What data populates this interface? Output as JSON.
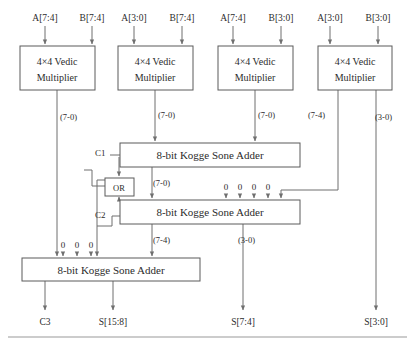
{
  "diagram": {
    "colors": {
      "wire": "#6f6f6f",
      "box_border": "#5a5a5a",
      "text": "#2b2b2b",
      "background": "#ffffff"
    },
    "inputs": [
      {
        "label": "A[7:4]",
        "x": 45,
        "y": 18
      },
      {
        "label": "B[7:4]",
        "x": 92,
        "y": 18
      },
      {
        "label": "A[3:0]",
        "x": 134,
        "y": 18
      },
      {
        "label": "B[7:4]",
        "x": 182,
        "y": 18
      },
      {
        "label": "A[7:4]",
        "x": 233,
        "y": 18
      },
      {
        "label": "B[3:0]",
        "x": 281,
        "y": 18
      },
      {
        "label": "A[3:0]",
        "x": 330,
        "y": 18
      },
      {
        "label": "B[3:0]",
        "x": 378,
        "y": 18
      }
    ],
    "multipliers": [
      {
        "line1": "4×4 Vedic",
        "line2": "Multiplier",
        "x": 20,
        "y": 46,
        "w": 75,
        "h": 44
      },
      {
        "line1": "4×4 Vedic",
        "line2": "Multiplier",
        "x": 118,
        "y": 46,
        "w": 75,
        "h": 44
      },
      {
        "line1": "4×4 Vedic",
        "line2": "Multiplier",
        "x": 218,
        "y": 46,
        "w": 75,
        "h": 44
      },
      {
        "line1": "4×4 Vedic",
        "line2": "Multiplier",
        "x": 318,
        "y": 46,
        "w": 74,
        "h": 44
      }
    ],
    "adders": [
      {
        "label": "8-bit Kogge Sone Adder",
        "x": 120,
        "y": 143,
        "w": 180,
        "h": 24
      },
      {
        "label": "8-bit Kogge Sone Adder",
        "x": 120,
        "y": 200,
        "w": 180,
        "h": 24
      },
      {
        "label": "8-bit Kogge Sone Adder",
        "x": 22,
        "y": 258,
        "w": 178,
        "h": 23
      }
    ],
    "or_gate": {
      "label": "OR",
      "x": 105,
      "y": 178,
      "w": 29,
      "h": 18
    },
    "bus_labels": [
      {
        "text": "(7-0)",
        "x": 60,
        "y": 120
      },
      {
        "text": "(7-0)",
        "x": 158,
        "y": 118
      },
      {
        "text": "(7-0)",
        "x": 258,
        "y": 118
      },
      {
        "text": "(7-4)",
        "x": 308,
        "y": 118
      },
      {
        "text": "(3-0)",
        "x": 375,
        "y": 120
      },
      {
        "text": "(7-0)",
        "x": 153,
        "y": 186
      },
      {
        "text": "(7-4)",
        "x": 153,
        "y": 243
      },
      {
        "text": "(3-0)",
        "x": 238,
        "y": 243
      }
    ],
    "carry_labels": [
      {
        "text": "C1",
        "x": 101,
        "y": 153
      },
      {
        "text": "C2",
        "x": 101,
        "y": 215
      }
    ],
    "zero_groups": [
      {
        "values": [
          "0",
          "0",
          "0",
          "0"
        ],
        "xs": [
          226,
          240,
          254,
          268
        ],
        "y": 190
      },
      {
        "values": [
          "0",
          "0",
          "0"
        ],
        "xs": [
          63,
          77,
          91
        ],
        "y": 248
      }
    ],
    "outputs": [
      {
        "label": "C3",
        "x": 45,
        "y": 322
      },
      {
        "label": "S[15:8]",
        "x": 113,
        "y": 322
      },
      {
        "label": "S[7:4]",
        "x": 243,
        "y": 322
      },
      {
        "label": "S[3:0]",
        "x": 376,
        "y": 322
      }
    ]
  }
}
